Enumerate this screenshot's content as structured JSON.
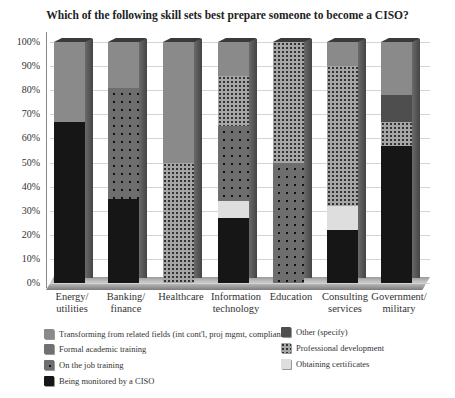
{
  "title": "Which of the following skill sets best prepare someone to become a CISO?",
  "y_ticks": [
    "100%",
    "90%",
    "80%",
    "70%",
    "60%",
    "50%",
    "40%",
    "30%",
    "20%",
    "10%",
    "0%"
  ],
  "categories": [
    {
      "line1": "Energy/",
      "line2": "utilities"
    },
    {
      "line1": "Banking/",
      "line2": "finance"
    },
    {
      "line1": "Healthcare",
      "line2": ""
    },
    {
      "line1": "Information",
      "line2": "technology"
    },
    {
      "line1": "Education",
      "line2": ""
    },
    {
      "line1": "Consulting",
      "line2": "services"
    },
    {
      "line1": "Government/",
      "line2": "military"
    }
  ],
  "legend": {
    "transform": "Transforming from related fields (int cont'l, proj mgmt, compliance)",
    "formal": "Formal academic training",
    "ojt": "On the job training",
    "ciso": "Being monitored by a CISO",
    "other": "Other (specify)",
    "prof": "Professional development",
    "cert": "Obtaining certificates"
  },
  "chart_data": {
    "type": "bar",
    "stacked": true,
    "style": "3d-stacked-100-percent",
    "title": "Which of the following skill sets best prepare someone to become a CISO?",
    "xlabel": "",
    "ylabel": "",
    "ylim": [
      0,
      100
    ],
    "y_tick_format": "percent",
    "grid": true,
    "legend_position": "bottom",
    "categories": [
      "Energy/utilities",
      "Banking/finance",
      "Healthcare",
      "Information technology",
      "Education",
      "Consulting services",
      "Government/military"
    ],
    "series": [
      {
        "name": "Being monitored by a CISO",
        "key": "ciso",
        "values": [
          67,
          35,
          0,
          27,
          0,
          22,
          57
        ]
      },
      {
        "name": "Obtaining certificates",
        "key": "cert",
        "values": [
          0,
          0,
          0,
          7,
          0,
          10,
          0
        ]
      },
      {
        "name": "On the job training",
        "key": "ojt",
        "values": [
          0,
          46,
          0,
          31,
          50,
          0,
          0
        ]
      },
      {
        "name": "Formal academic training",
        "key": "formal",
        "values": [
          0,
          0,
          0,
          0,
          0,
          0,
          0
        ]
      },
      {
        "name": "Professional development",
        "key": "prof",
        "values": [
          0,
          0,
          50,
          21,
          50,
          58,
          10
        ]
      },
      {
        "name": "Other (specify)",
        "key": "other",
        "values": [
          0,
          0,
          0,
          0,
          0,
          0,
          11
        ]
      },
      {
        "name": "Transforming from related fields (int cont'l, proj mgmt, compliance)",
        "key": "transform",
        "values": [
          33,
          19,
          50,
          14,
          0,
          10,
          22
        ]
      }
    ]
  }
}
